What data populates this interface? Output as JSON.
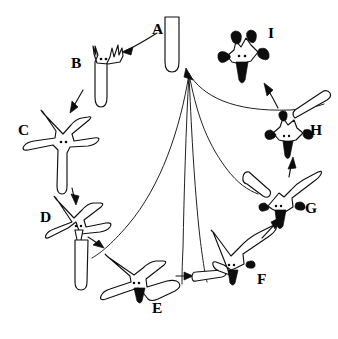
{
  "figure": {
    "kind": "biological-life-cycle-diagram",
    "background_color": "#ffffff",
    "ink_color": "#111111",
    "fill_color": "#0d0d0d"
  },
  "labels": [
    {
      "id": "A",
      "text": "A",
      "x": 152,
      "y": 34,
      "stage": "rod-cell",
      "note": "plain rod-shaped cell, rounded base"
    },
    {
      "id": "B",
      "text": "B",
      "x": 71,
      "y": 68,
      "stage": "budding-rod",
      "note": "rod with small finger-like buds at apex and two internal dots"
    },
    {
      "id": "C",
      "text": "C",
      "x": 18,
      "y": 135,
      "stage": "five-armed-star",
      "note": "open five-armed star with long lower arm, two dots at centre"
    },
    {
      "id": "D",
      "text": "D",
      "x": 40,
      "y": 222,
      "stage": "star-releasing-arm",
      "note": "star with lower arm detaching and small beak forming"
    },
    {
      "id": "E",
      "text": "E",
      "x": 152,
      "y": 313,
      "stage": "rotated-star-dark-beak",
      "note": "star rotated, dark filled beak at lower centre"
    },
    {
      "id": "F",
      "text": "F",
      "x": 257,
      "y": 284,
      "stage": "star-dark-tip",
      "note": "star with dark beak and one darkened arm tip"
    },
    {
      "id": "G",
      "text": "G",
      "x": 305,
      "y": 213,
      "stage": "compact-star-two-dark-tips",
      "note": "compact star with two dark arm tips and dark beak"
    },
    {
      "id": "H",
      "text": "H",
      "x": 310,
      "y": 135,
      "stage": "star-three-dark-tips",
      "note": "star with three dark arm tips and dark beak"
    },
    {
      "id": "I",
      "text": "I",
      "x": 268,
      "y": 38,
      "stage": "star-all-dark-tips",
      "note": "star with all arm tips darkened and dark beak"
    }
  ],
  "sequence": {
    "order": [
      "A",
      "B",
      "C",
      "D",
      "E",
      "F",
      "G",
      "H",
      "I"
    ],
    "direction": "counter-clockwise",
    "returns_to": "A"
  },
  "arrows": [
    {
      "from": "A",
      "to": "B",
      "name": "arrow-a-to-b"
    },
    {
      "from": "B",
      "to": "C",
      "name": "arrow-b-to-c"
    },
    {
      "from": "C",
      "to": "D",
      "name": "arrow-c-to-d"
    },
    {
      "from": "D",
      "to": "E",
      "name": "arrow-d-to-e"
    },
    {
      "from": "E",
      "to": "F",
      "name": "arrow-e-to-f"
    },
    {
      "from": "F",
      "to": "G",
      "name": "arrow-f-to-g"
    },
    {
      "from": "G",
      "to": "H",
      "name": "arrow-g-to-h"
    },
    {
      "from": "H",
      "to": "I",
      "name": "arrow-h-to-i"
    },
    {
      "from": "I",
      "to": "A",
      "name": "arrow-i-to-a",
      "style": "long-curve"
    }
  ],
  "released_rods": [
    {
      "from_stage": "D",
      "name": "released-rod-d"
    },
    {
      "from_stage": "E",
      "name": "released-rod-e"
    },
    {
      "from_stage": "F",
      "name": "released-rod-f"
    },
    {
      "from_stage": "G",
      "name": "released-rod-g"
    },
    {
      "from_stage": "H",
      "name": "released-rod-h"
    }
  ],
  "return_curves": {
    "count": 5,
    "converge_at": {
      "x": 188,
      "y": 72
    },
    "note": "long curved lines from detached rods of stages D-H converging with an arrowhead back toward stage A"
  }
}
